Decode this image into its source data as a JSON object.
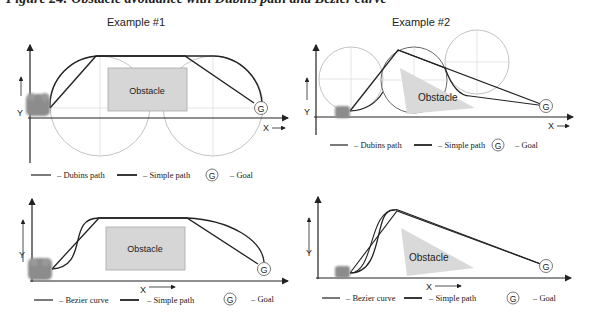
{
  "figure": {
    "caption": "Figure 24: Obstacle avoidance with Dubins path and Bezier curve"
  },
  "panels": [
    {
      "id": "dubins-example-1",
      "title": "Example #1",
      "obstacle_label": "Obstacle",
      "obstacle_shape": "rectangle",
      "axis_x": "X",
      "axis_y": "Y",
      "goal": "G",
      "legend": [
        {
          "symbol": "line",
          "label": "– Dubins path"
        },
        {
          "symbol": "thick-line",
          "label": "– Simple path"
        },
        {
          "symbol": "goal-circle",
          "glyph": "G",
          "label": "– Goal"
        }
      ]
    },
    {
      "id": "dubins-example-2",
      "title": "Example #2",
      "obstacle_label": "Obstacle",
      "obstacle_shape": "triangle",
      "axis_x": "X",
      "axis_y": "Y",
      "goal": "G",
      "legend": [
        {
          "symbol": "line",
          "label": "– Dubins path"
        },
        {
          "symbol": "thick-line",
          "label": "– Simple path"
        },
        {
          "symbol": "goal-circle",
          "glyph": "G",
          "label": "– Goal"
        }
      ]
    },
    {
      "id": "bezier-example-1",
      "title": "",
      "obstacle_label": "Obstacle",
      "obstacle_shape": "rectangle",
      "axis_x": "X",
      "axis_y": "Y",
      "goal": "G",
      "legend": [
        {
          "symbol": "line",
          "label": "– Bezier curve"
        },
        {
          "symbol": "thick-line",
          "label": "– Simple path"
        },
        {
          "symbol": "goal-circle",
          "glyph": "G",
          "label": "– Goal"
        }
      ]
    },
    {
      "id": "bezier-example-2",
      "title": "",
      "obstacle_label": "Obstacle",
      "obstacle_shape": "triangle",
      "axis_x": "X",
      "axis_y": "Y",
      "goal": "G",
      "legend": [
        {
          "symbol": "line",
          "label": "– Bezier curve"
        },
        {
          "symbol": "thick-line",
          "label": "– Simple path"
        },
        {
          "symbol": "goal-circle",
          "glyph": "G",
          "label": "– Goal"
        }
      ]
    }
  ],
  "colors": {
    "path": "#222222",
    "obstacle_fill": "#d6d6d6",
    "obstacle_stroke": "#aaaaaa",
    "turn_circle": "#b0b0b0",
    "guide": "#d0d0d0",
    "robot": "#8c8c8c"
  }
}
